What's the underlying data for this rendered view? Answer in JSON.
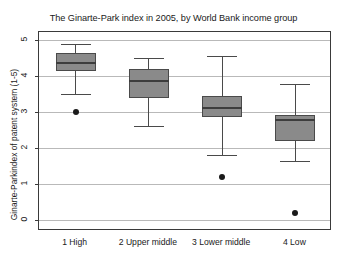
{
  "chart_data": {
    "type": "box",
    "title": "The Ginarte-Park index in 2005, by World Bank income group",
    "xlabel": "",
    "ylabel": "Ginarte-Parkindex of patent system (1-5)",
    "ylim": [
      0,
      5
    ],
    "yticks": [
      "0",
      "1",
      "2",
      "3",
      "4",
      "5"
    ],
    "grid": true,
    "legend": "none",
    "categories": [
      "1 High",
      "2 Upper middle",
      "3 Lower middle",
      "4 Low"
    ],
    "boxes": [
      {
        "category": "1 High",
        "whisker_low": 3.5,
        "q1": 4.15,
        "median": 4.35,
        "q3": 4.65,
        "whisker_high": 4.9,
        "outliers": [
          3.0
        ]
      },
      {
        "category": "2 Upper middle",
        "whisker_low": 2.6,
        "q1": 3.4,
        "median": 3.85,
        "q3": 4.2,
        "whisker_high": 4.5,
        "outliers": []
      },
      {
        "category": "3 Lower middle",
        "whisker_low": 1.8,
        "q1": 2.85,
        "median": 3.1,
        "q3": 3.45,
        "whisker_high": 4.55,
        "outliers": [
          1.2
        ]
      },
      {
        "category": "4 Low",
        "whisker_low": 1.65,
        "q1": 2.2,
        "median": 2.78,
        "q3": 2.92,
        "whisker_high": 3.77,
        "outliers": [
          0.2
        ]
      }
    ],
    "colors": {
      "box_fill": "#8a8a8a",
      "box_edge": "#4a4a4a",
      "median": "#3d3d3d",
      "gridline": "#b9b9b9",
      "frame": "#3a3a3a",
      "outlier": "#1a1a1a",
      "text": "#1a1a1a",
      "background": "#ffffff"
    }
  }
}
